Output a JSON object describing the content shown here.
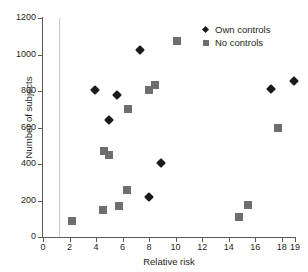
{
  "chart_data": {
    "type": "scatter",
    "title": "",
    "xlabel": "Relative risk",
    "ylabel": "Number of subjects",
    "xlim": [
      0,
      19
    ],
    "ylim": [
      0,
      1200
    ],
    "xticks": [
      0,
      2,
      4,
      6,
      8,
      10,
      12,
      14,
      16,
      18,
      19
    ],
    "yticks": [
      0,
      200,
      400,
      600,
      800,
      1000,
      1200
    ],
    "grid": false,
    "legend_position": "top-right",
    "annotations": [
      {
        "name": "reference-line",
        "type": "vline",
        "x": 1.2,
        "color": "#c9c9c9"
      }
    ],
    "series": [
      {
        "name": "Own controls",
        "marker": "diamond",
        "color": "#1a1a1a",
        "points": [
          {
            "x": 3.9,
            "y": 807
          },
          {
            "x": 5.0,
            "y": 640
          },
          {
            "x": 5.6,
            "y": 778
          },
          {
            "x": 7.3,
            "y": 1025
          },
          {
            "x": 8.0,
            "y": 218
          },
          {
            "x": 8.9,
            "y": 405
          },
          {
            "x": 17.2,
            "y": 812
          },
          {
            "x": 18.9,
            "y": 855
          }
        ]
      },
      {
        "name": "No controls",
        "marker": "square",
        "color": "#6e6e6e",
        "points": [
          {
            "x": 2.2,
            "y": 90
          },
          {
            "x": 4.5,
            "y": 150
          },
          {
            "x": 4.6,
            "y": 470
          },
          {
            "x": 5.0,
            "y": 450
          },
          {
            "x": 5.7,
            "y": 170
          },
          {
            "x": 6.35,
            "y": 258
          },
          {
            "x": 6.4,
            "y": 702
          },
          {
            "x": 8.0,
            "y": 805
          },
          {
            "x": 8.45,
            "y": 835
          },
          {
            "x": 10.1,
            "y": 1072
          },
          {
            "x": 14.8,
            "y": 110
          },
          {
            "x": 15.45,
            "y": 175
          },
          {
            "x": 17.7,
            "y": 600
          }
        ]
      }
    ]
  },
  "legend": {
    "items": [
      {
        "label": "Own controls",
        "marker": "diamond",
        "color": "#1a1a1a"
      },
      {
        "label": "No controls",
        "marker": "square",
        "color": "#6e6e6e"
      }
    ]
  },
  "colors": {
    "axis": "#58595b",
    "text": "#231f20",
    "own_controls": "#1a1a1a",
    "no_controls": "#6e6e6e",
    "reference_line": "#c9c9c9",
    "background": "#ffffff"
  }
}
